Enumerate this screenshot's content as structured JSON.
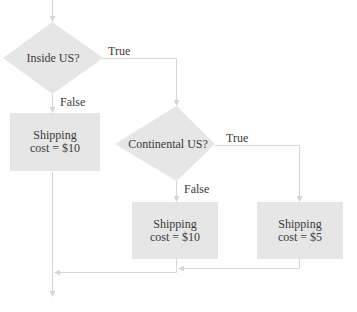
{
  "diagram": {
    "type": "flowchart",
    "colors": {
      "node_fill": "#e6e6e6",
      "connector": "#d6d6d6",
      "text": "#3a3a3a"
    },
    "nodes": [
      {
        "id": "d1",
        "shape": "diamond",
        "label": "Inside US?"
      },
      {
        "id": "b1",
        "shape": "rect",
        "line1": "Shipping",
        "line2": "cost = $10"
      },
      {
        "id": "d2",
        "shape": "diamond",
        "label": "Continental US?"
      },
      {
        "id": "b2",
        "shape": "rect",
        "line1": "Shipping",
        "line2": "cost = $10"
      },
      {
        "id": "b3",
        "shape": "rect",
        "line1": "Shipping",
        "line2": "cost = $5"
      }
    ],
    "edges": [
      {
        "from": "d1",
        "to": "b1",
        "label": "False"
      },
      {
        "from": "d1",
        "to": "d2",
        "label": "True"
      },
      {
        "from": "d2",
        "to": "b2",
        "label": "False"
      },
      {
        "from": "d2",
        "to": "b3",
        "label": "True"
      }
    ]
  }
}
